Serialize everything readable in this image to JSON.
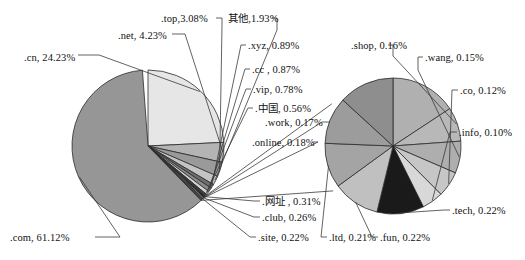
{
  "chart_data": {
    "type": "pie",
    "title": "",
    "subtitle": "",
    "xlabel": "",
    "ylabel": "",
    "legend_position": "none",
    "grid": false,
    "panels": [
      {
        "name": "main-pie",
        "categories": [
          ".com",
          ".cn",
          ".net",
          ".top",
          "其他",
          ".xyz",
          ".cc",
          ".vip",
          ".中国",
          ".online",
          ".work",
          ".网址",
          ".club",
          ".site"
        ],
        "values": [
          61.12,
          24.23,
          4.23,
          3.08,
          1.93,
          0.89,
          0.87,
          0.78,
          0.56,
          0.18,
          0.17,
          0.31,
          0.26,
          0.22
        ],
        "unit": "%"
      },
      {
        "name": "detail-pie",
        "categories": [
          ".shop",
          ".wang",
          ".co",
          ".info",
          ".tech",
          ".fun",
          ".ltd",
          ".site",
          ".club",
          ".网址"
        ],
        "values": [
          0.16,
          0.15,
          0.12,
          0.1,
          0.22,
          0.22,
          0.21,
          0.22,
          0.26,
          0.31
        ],
        "unit": "%"
      }
    ]
  },
  "labels": {
    "cn": ".cn, 24.23%",
    "net": ".net, 4.23%",
    "top": ".top,3.08%",
    "other": "其他,1.93%",
    "xyz": ".xyz, 0.89%",
    "cc": ".cc , 0.87%",
    "vip": ".vip, 0.78%",
    "zhongguo": ".中国, 0.56%",
    "work": ".work, 0.17%",
    "online": ".online, 0.18%",
    "wangzhi": ".网址 , 0.31%",
    "club": ".club, 0.26%",
    "site": ".site, 0.22%",
    "com": ".com, 61.12%",
    "shop": ".shop, 0.16%",
    "wang": ".wang, 0.15%",
    "co": ".co, 0.12%",
    "info": ".info, 0.10%",
    "tech": ".tech, 0.22%",
    "fun": ".fun, 0.22%",
    "ltd": ".ltd, 0.21%"
  },
  "colors": {
    "com": "#969696",
    "cn": "#e6e6e6",
    "net": "#b4b4b4",
    "top": "#9a9a9a",
    "other": "#c4c4c4",
    "xyz": "#6e6e6e",
    "cc": "#8a8a8a",
    "vip": "#d2d2d2",
    "zhongguo": "#3c3c3c",
    "wangzhi": "#1f1f1f",
    "club": "#a8a8a8",
    "site": "#585858",
    "online": "#cdcdcd",
    "work": "#7c7c7c",
    "detail_shop": "#b8b8b8",
    "detail_wang": "#aeaeae",
    "detail_co": "#c6c6c6",
    "detail_info": "#d8d8d8",
    "detail_tech": "#1a1a1a",
    "detail_fun": "#c0c0c0",
    "detail_ltd": "#a4a4a4",
    "detail_site": "#9c9c9c",
    "detail_club": "#8e8e8e",
    "detail_wz": "#b0b0b0",
    "outline": "#2b2b2b",
    "leader": "#3a3a3a"
  }
}
